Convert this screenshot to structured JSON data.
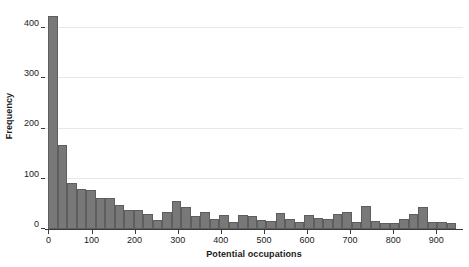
{
  "chart_data": {
    "type": "bar",
    "title": "",
    "subtitle": "",
    "xlabel": "Potential occupations",
    "ylabel": "Frequency",
    "grid": "horizontal",
    "legend": "none",
    "bar_color": "#787878",
    "bar_edge_color": "#5e5e5e",
    "grid_color": "#e8e8e8",
    "axis_color": "#3a3a3a",
    "text_color": "#1a1a1a",
    "xlim": [
      -8,
      962
    ],
    "ylim": [
      0,
      440
    ],
    "xticks": [
      0,
      100,
      200,
      300,
      400,
      500,
      600,
      700,
      800,
      900
    ],
    "xtick_labels": [
      "0",
      "100",
      "200",
      "300",
      "400",
      "500",
      "600",
      "700",
      "800",
      "900"
    ],
    "yticks": [
      0,
      100,
      200,
      300,
      400
    ],
    "ytick_labels": [
      "0",
      "100",
      "200",
      "300",
      "400"
    ],
    "bin_width": 22,
    "bin_starts": [
      0,
      22,
      44,
      66,
      88,
      110,
      132,
      154,
      176,
      198,
      220,
      242,
      264,
      286,
      308,
      330,
      352,
      374,
      396,
      418,
      440,
      462,
      484,
      506,
      528,
      550,
      572,
      594,
      616,
      638,
      660,
      682,
      704,
      726,
      748,
      770,
      792,
      814,
      836,
      858,
      880,
      902,
      924
    ],
    "values": [
      425,
      167,
      91,
      79,
      77,
      62,
      62,
      48,
      38,
      37,
      30,
      17,
      34,
      55,
      44,
      25,
      33,
      19,
      27,
      14,
      27,
      26,
      17,
      15,
      31,
      20,
      13,
      27,
      22,
      20,
      30,
      34,
      14,
      45,
      16,
      12,
      12,
      19,
      30,
      44,
      14,
      13,
      11
    ]
  }
}
